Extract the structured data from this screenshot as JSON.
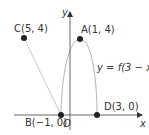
{
  "diagram": {
    "axes": {
      "x_label": "x",
      "y_label": "y",
      "origin_label": "O"
    },
    "points": [
      {
        "name": "A",
        "label": "A(1, 4)",
        "x": 1,
        "y": 4
      },
      {
        "name": "B",
        "label": "B(−1, 0)",
        "x": -1,
        "y": 0
      },
      {
        "name": "C",
        "label": "C(5, 4)",
        "x": 5,
        "y": 4
      },
      {
        "name": "D",
        "label": "D(3, 0)",
        "x": 3,
        "y": 0
      }
    ],
    "curve_label": "y = f(3 − x)",
    "colors": {
      "axis": "#555555",
      "curve": "#bbbbbb",
      "point": "#222222",
      "line": "#cccccc"
    }
  }
}
